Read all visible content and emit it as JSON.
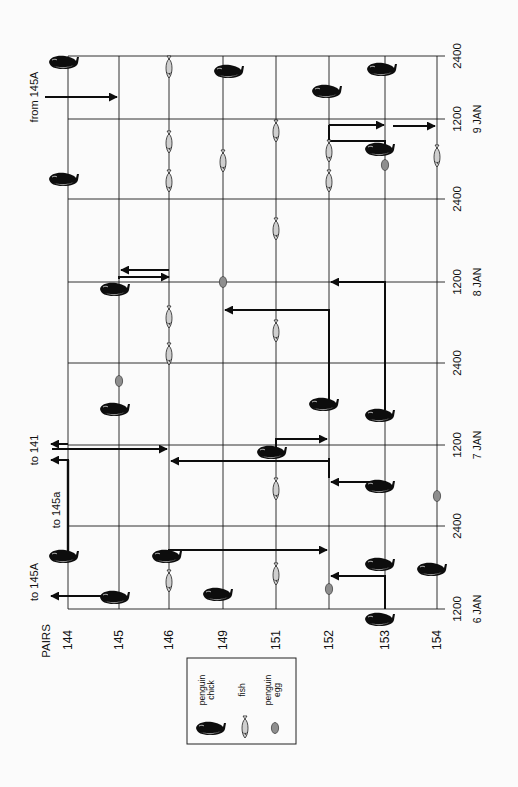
{
  "figure": {
    "orientation": "rotated-90-ccw",
    "axis_header": "PAIRS",
    "pairs": [
      {
        "id": "144",
        "x": 68
      },
      {
        "id": "145",
        "x": 119
      },
      {
        "id": "146",
        "x": 169
      },
      {
        "id": "149",
        "x": 223
      },
      {
        "id": "151",
        "x": 276
      },
      {
        "id": "152",
        "x": 329
      },
      {
        "id": "153",
        "x": 385
      },
      {
        "id": "154",
        "x": 437
      }
    ],
    "time_lines": [
      {
        "label": "2400",
        "date": "",
        "y": 56
      },
      {
        "label": "1200",
        "date": "9 JAN",
        "y": 119
      },
      {
        "label": "2400",
        "date": "",
        "y": 199
      },
      {
        "label": "1200",
        "date": "8 JAN",
        "y": 282
      },
      {
        "label": "2400",
        "date": "",
        "y": 363
      },
      {
        "label": "1200",
        "date": "7 JAN",
        "y": 445
      },
      {
        "label": "2400",
        "date": "",
        "y": 526
      },
      {
        "label": "1200",
        "date": "6 JAN",
        "y": 609
      }
    ],
    "annotations": [
      {
        "text": "from 145A",
        "x": 38,
        "y": 97
      },
      {
        "text": "to 141",
        "x": 38,
        "y": 450
      },
      {
        "text": "to 145a",
        "x": 60,
        "y": 510
      },
      {
        "text": "to 145A",
        "x": 38,
        "y": 582
      }
    ],
    "chicks": [
      {
        "pair": "144",
        "x": 62,
        "y": 63
      },
      {
        "pair": "146",
        "x": 227,
        "y": 72
      },
      {
        "pair": "152",
        "x": 325,
        "y": 92
      },
      {
        "pair": "153",
        "x": 380,
        "y": 70
      },
      {
        "pair": "153",
        "x": 378,
        "y": 150
      },
      {
        "pair": "144",
        "x": 62,
        "y": 180
      },
      {
        "pair": "145",
        "x": 113,
        "y": 290
      },
      {
        "pair": "145",
        "x": 113,
        "y": 410
      },
      {
        "pair": "152",
        "x": 322,
        "y": 405
      },
      {
        "pair": "153",
        "x": 378,
        "y": 416
      },
      {
        "pair": "151",
        "x": 270,
        "y": 453
      },
      {
        "pair": "153",
        "x": 378,
        "y": 487
      },
      {
        "pair": "144",
        "x": 62,
        "y": 557
      },
      {
        "pair": "146",
        "x": 165,
        "y": 557
      },
      {
        "pair": "153",
        "x": 378,
        "y": 565
      },
      {
        "pair": "154",
        "x": 430,
        "y": 570
      },
      {
        "pair": "145",
        "x": 113,
        "y": 598
      },
      {
        "pair": "149",
        "x": 216,
        "y": 595
      },
      {
        "pair": "153",
        "x": 378,
        "y": 620
      }
    ],
    "fish": [
      {
        "pair": "146",
        "y": 68
      },
      {
        "pair": "146",
        "y": 143
      },
      {
        "pair": "146",
        "y": 182
      },
      {
        "pair": "149",
        "y": 162
      },
      {
        "pair": "151",
        "y": 132
      },
      {
        "pair": "151",
        "y": 230
      },
      {
        "pair": "152",
        "y": 152
      },
      {
        "pair": "152",
        "y": 182
      },
      {
        "pair": "154",
        "y": 157
      },
      {
        "pair": "146",
        "y": 318
      },
      {
        "pair": "146",
        "y": 355
      },
      {
        "pair": "151",
        "y": 332
      },
      {
        "pair": "151",
        "y": 490
      },
      {
        "pair": "146",
        "y": 582
      },
      {
        "pair": "151",
        "y": 575
      }
    ],
    "eggs": [
      {
        "pair": "153",
        "y": 165
      },
      {
        "pair": "149",
        "y": 282
      },
      {
        "pair": "145",
        "y": 381
      },
      {
        "pair": "154",
        "y": 496
      },
      {
        "pair": "152",
        "y": 589
      }
    ],
    "arrows": [
      {
        "from": "from 145A",
        "points": [
          [
            45,
            97
          ],
          [
            117,
            97
          ]
        ]
      },
      {
        "from": "152",
        "to": "153",
        "points": [
          [
            329,
            125
          ],
          [
            384,
            125
          ]
        ]
      },
      {
        "from": "152",
        "to": "153",
        "points": [
          [
            329,
            125
          ],
          [
            329,
            141
          ],
          [
            385,
            141
          ],
          [
            385,
            147
          ]
        ],
        "head": false
      },
      {
        "from": "153",
        "to": "154",
        "points": [
          [
            393,
            126
          ],
          [
            435,
            126
          ]
        ]
      },
      {
        "from": "145",
        "to": "146",
        "points": [
          [
            119,
            279
          ],
          [
            119,
            277
          ],
          [
            169,
            277
          ]
        ],
        "head_dir": "right"
      },
      {
        "from": "146",
        "to": "145",
        "points": [
          [
            169,
            270
          ],
          [
            169,
            270
          ],
          [
            121,
            270
          ]
        ]
      },
      {
        "from": "153",
        "to": "152",
        "points": [
          [
            385,
            410
          ],
          [
            385,
            282
          ],
          [
            331,
            282
          ]
        ]
      },
      {
        "from": "152",
        "to": "149",
        "points": [
          [
            329,
            400
          ],
          [
            329,
            310
          ],
          [
            225,
            310
          ]
        ]
      },
      {
        "from": "144",
        "to": "141",
        "points": [
          [
            68,
            444
          ],
          [
            51,
            444
          ]
        ]
      },
      {
        "from": "144",
        "to": "146",
        "points": [
          [
            52,
            449
          ],
          [
            167,
            449
          ]
        ]
      },
      {
        "from": "151",
        "to": "152",
        "points": [
          [
            276,
            453
          ],
          [
            276,
            439
          ],
          [
            327,
            439
          ]
        ]
      },
      {
        "from": "152",
        "to": "146",
        "points": [
          [
            329,
            458
          ],
          [
            329,
            461
          ],
          [
            171,
            461
          ]
        ],
        "note": "long horizontal feed"
      },
      {
        "from": "152",
        "to": "146",
        "points": [
          [
            329,
            478
          ],
          [
            329,
            461
          ]
        ],
        "head": false
      },
      {
        "from": "153",
        "to": "152",
        "points": [
          [
            385,
            485
          ],
          [
            385,
            482
          ],
          [
            331,
            482
          ]
        ]
      },
      {
        "from": "144",
        "to": "145a",
        "points": [
          [
            68,
            550
          ],
          [
            68,
            460
          ],
          [
            51,
            460
          ]
        ]
      },
      {
        "from": "146",
        "to": "152",
        "points": [
          [
            169,
            556
          ],
          [
            169,
            550
          ],
          [
            327,
            550
          ]
        ]
      },
      {
        "from": "153",
        "to": "152",
        "points": [
          [
            385,
            609
          ],
          [
            385,
            576
          ],
          [
            331,
            576
          ]
        ]
      },
      {
        "from": "145",
        "to": "145A",
        "points": [
          [
            119,
            600
          ],
          [
            119,
            596
          ],
          [
            51,
            596
          ]
        ]
      }
    ],
    "legend": {
      "items": [
        {
          "symbol": "chick",
          "label": "penguin chick"
        },
        {
          "symbol": "fish",
          "label": "fish"
        },
        {
          "symbol": "egg",
          "label": "penguin egg"
        }
      ]
    }
  }
}
